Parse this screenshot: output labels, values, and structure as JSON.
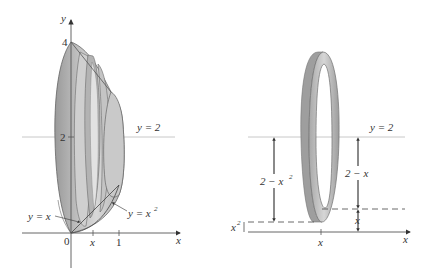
{
  "left_figure": {
    "y_axis_label": "y",
    "x_axis_label": "x",
    "tick_4": "4",
    "tick_2": "2",
    "origin": "0",
    "tick_x": "x",
    "tick_1": "1",
    "line_label": "y = 2",
    "curve_label_line": "y = x",
    "curve_label_parabola": "y = x",
    "parabola_exponent": "2"
  },
  "right_figure": {
    "x_axis_label": "x",
    "tick_x": "x",
    "line_label": "y = 2",
    "outer_radius_label": "2 − x",
    "outer_radius_exponent": "2",
    "inner_radius_label": "2 − x",
    "gap_label_x": "x",
    "gap_label_x2": "x",
    "gap_label_x2_exponent": "2"
  },
  "colors": {
    "solid_fill": "#b8b8b8",
    "solid_dark": "#8e8e8e",
    "solid_light": "#d4d4d4",
    "axis": "#555555",
    "guide_line": "#c8c8c8"
  }
}
